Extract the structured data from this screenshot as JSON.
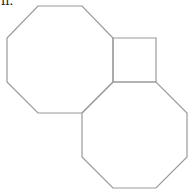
{
  "figure": {
    "label": "ii.",
    "stroke_color": "#9a9a9a",
    "shapes": [
      {
        "name": "left-octagon",
        "type": "regular-octagon",
        "points": "38,6 82,6 113,38 113,82 82,113 38,113 7,82 7,38"
      },
      {
        "name": "square",
        "type": "square",
        "points": "113,38 156,38 156,82 113,82"
      },
      {
        "name": "right-octagon",
        "type": "regular-octagon",
        "points": "113,82 156,82 187,113 187,157 156,188 113,188 82,157 82,113"
      }
    ]
  }
}
